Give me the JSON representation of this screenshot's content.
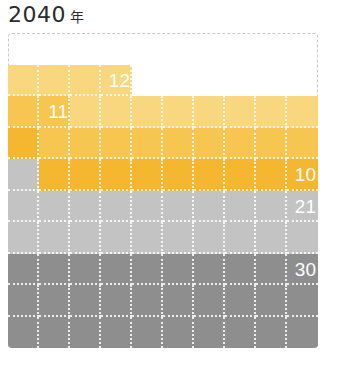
{
  "title": {
    "year": "2040",
    "unit": "年"
  },
  "chart_data": {
    "type": "waffle",
    "grid": {
      "rows": 10,
      "cols": 10,
      "total": 100,
      "fill_order": "bottom-up, row-wise"
    },
    "series": [
      {
        "name": "segment-5 (dark gray)",
        "value": 30,
        "color": "#8e8e8e",
        "label": "30"
      },
      {
        "name": "segment-4 (light gray)",
        "value": 21,
        "color": "#c3c3c3",
        "label": "21"
      },
      {
        "name": "segment-3 (dark yellow)",
        "value": 10,
        "color": "#f5b630",
        "label": "10"
      },
      {
        "name": "segment-2 (medium yellow)",
        "value": 11,
        "color": "#f6c650",
        "label": "11"
      },
      {
        "name": "segment-1 (light yellow)",
        "value": 12,
        "color": "#f8d77e",
        "label": "12"
      }
    ],
    "empty_cells": 16
  }
}
